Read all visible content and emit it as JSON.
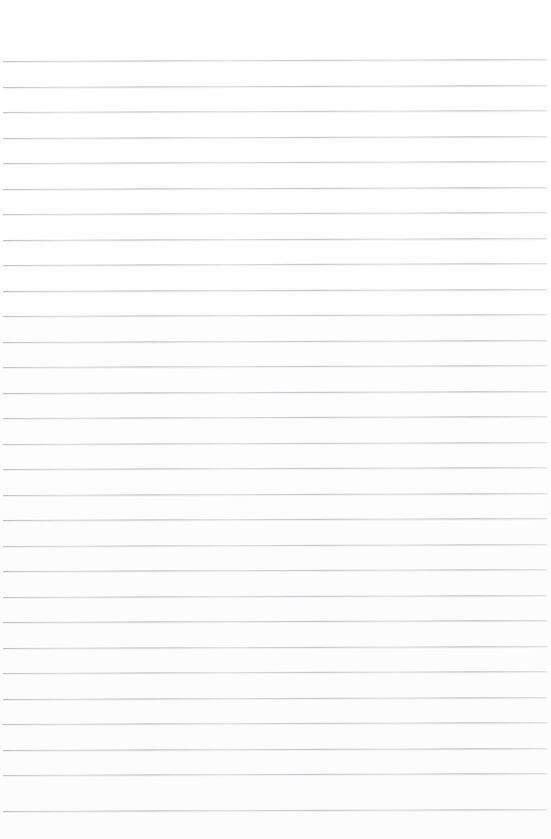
{
  "document": {
    "kind": "scanned-lined-paper",
    "title": "Blank ruled notebook page",
    "page_width": 551,
    "page_height": 839,
    "background_color": "#fefefe",
    "content_text": "",
    "has_visible_text": false,
    "has_margin_rule": false,
    "has_holes": false
  },
  "ruling": {
    "line_color": "#c9c9ce",
    "line_thickness_px": 1,
    "line_count": 30,
    "first_line_y": 61,
    "line_spacing_px": 25.5,
    "last_line_y": 810.5,
    "left_edge_x": 3,
    "right_edge_x": 547,
    "skew_rise_px": -2,
    "skew_note": "lines rise ~2px from left edge to right edge",
    "lines": [
      {
        "index": 1,
        "y": 61.0,
        "x_start": 3,
        "x_end": 547,
        "opacity": 0.92
      },
      {
        "index": 2,
        "y": 86.5,
        "x_start": 3,
        "x_end": 547,
        "opacity": 0.95
      },
      {
        "index": 3,
        "y": 112.0,
        "x_start": 3,
        "x_end": 547,
        "opacity": 0.88
      },
      {
        "index": 4,
        "y": 137.5,
        "x_start": 3,
        "x_end": 547,
        "opacity": 0.93
      },
      {
        "index": 5,
        "y": 163.0,
        "x_start": 3,
        "x_end": 547,
        "opacity": 0.9
      },
      {
        "index": 6,
        "y": 188.5,
        "x_start": 3,
        "x_end": 547,
        "opacity": 0.96
      },
      {
        "index": 7,
        "y": 214.0,
        "x_start": 3,
        "x_end": 547,
        "opacity": 0.89
      },
      {
        "index": 8,
        "y": 239.5,
        "x_start": 3,
        "x_end": 547,
        "opacity": 0.94
      },
      {
        "index": 9,
        "y": 265.0,
        "x_start": 3,
        "x_end": 547,
        "opacity": 0.91
      },
      {
        "index": 10,
        "y": 290.5,
        "x_start": 3,
        "x_end": 547,
        "opacity": 0.95
      },
      {
        "index": 11,
        "y": 316.0,
        "x_start": 3,
        "x_end": 547,
        "opacity": 0.88
      },
      {
        "index": 12,
        "y": 341.5,
        "x_start": 3,
        "x_end": 547,
        "opacity": 0.93
      },
      {
        "index": 13,
        "y": 367.0,
        "x_start": 3,
        "x_end": 547,
        "opacity": 0.9
      },
      {
        "index": 14,
        "y": 392.5,
        "x_start": 3,
        "x_end": 547,
        "opacity": 0.96
      },
      {
        "index": 15,
        "y": 418.0,
        "x_start": 3,
        "x_end": 547,
        "opacity": 0.92
      },
      {
        "index": 16,
        "y": 443.5,
        "x_start": 3,
        "x_end": 547,
        "opacity": 0.89
      },
      {
        "index": 17,
        "y": 469.0,
        "x_start": 3,
        "x_end": 547,
        "opacity": 0.94
      },
      {
        "index": 18,
        "y": 494.5,
        "x_start": 3,
        "x_end": 547,
        "opacity": 0.91
      },
      {
        "index": 19,
        "y": 520.0,
        "x_start": 3,
        "x_end": 547,
        "opacity": 0.95
      },
      {
        "index": 20,
        "y": 545.5,
        "x_start": 3,
        "x_end": 547,
        "opacity": 0.88
      },
      {
        "index": 21,
        "y": 571.0,
        "x_start": 3,
        "x_end": 547,
        "opacity": 0.93
      },
      {
        "index": 22,
        "y": 596.5,
        "x_start": 3,
        "x_end": 547,
        "opacity": 0.9
      },
      {
        "index": 23,
        "y": 622.0,
        "x_start": 3,
        "x_end": 547,
        "opacity": 0.96
      },
      {
        "index": 24,
        "y": 647.5,
        "x_start": 3,
        "x_end": 547,
        "opacity": 0.92
      },
      {
        "index": 25,
        "y": 673.0,
        "x_start": 3,
        "x_end": 547,
        "opacity": 0.89
      },
      {
        "index": 26,
        "y": 698.5,
        "x_start": 3,
        "x_end": 547,
        "opacity": 0.94
      },
      {
        "index": 27,
        "y": 724.0,
        "x_start": 3,
        "x_end": 547,
        "opacity": 0.91
      },
      {
        "index": 28,
        "y": 749.5,
        "x_start": 3,
        "x_end": 547,
        "opacity": 0.95
      },
      {
        "index": 29,
        "y": 775.0,
        "x_start": 3,
        "x_end": 547,
        "opacity": 0.9
      },
      {
        "index": 30,
        "y": 810.5,
        "x_start": 3,
        "x_end": 547,
        "opacity": 0.93
      }
    ]
  }
}
